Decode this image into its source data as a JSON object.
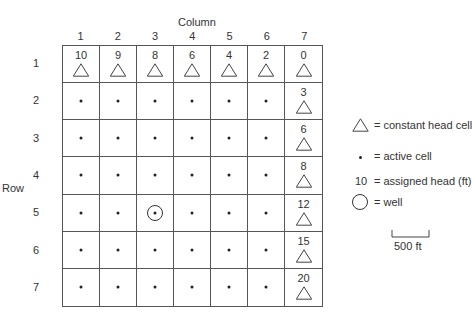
{
  "diagram": {
    "column_axis_title": "Column",
    "row_axis_title": "Row",
    "column_labels": [
      "1",
      "2",
      "3",
      "4",
      "5",
      "6",
      "7"
    ],
    "row_labels": [
      "1",
      "2",
      "3",
      "4",
      "5",
      "6",
      "7"
    ],
    "cells": [
      [
        {
          "type": "constant",
          "head": "10"
        },
        {
          "type": "constant",
          "head": "9"
        },
        {
          "type": "constant",
          "head": "8"
        },
        {
          "type": "constant",
          "head": "6"
        },
        {
          "type": "constant",
          "head": "4"
        },
        {
          "type": "constant",
          "head": "2"
        },
        {
          "type": "constant",
          "head": "0"
        }
      ],
      [
        {
          "type": "active"
        },
        {
          "type": "active"
        },
        {
          "type": "active"
        },
        {
          "type": "active"
        },
        {
          "type": "active"
        },
        {
          "type": "active"
        },
        {
          "type": "constant",
          "head": "3"
        }
      ],
      [
        {
          "type": "active"
        },
        {
          "type": "active"
        },
        {
          "type": "active"
        },
        {
          "type": "active"
        },
        {
          "type": "active"
        },
        {
          "type": "active"
        },
        {
          "type": "constant",
          "head": "6"
        }
      ],
      [
        {
          "type": "active"
        },
        {
          "type": "active"
        },
        {
          "type": "active"
        },
        {
          "type": "active"
        },
        {
          "type": "active"
        },
        {
          "type": "active"
        },
        {
          "type": "constant",
          "head": "8"
        }
      ],
      [
        {
          "type": "active"
        },
        {
          "type": "active"
        },
        {
          "type": "well"
        },
        {
          "type": "active"
        },
        {
          "type": "active"
        },
        {
          "type": "active"
        },
        {
          "type": "constant",
          "head": "12"
        }
      ],
      [
        {
          "type": "active"
        },
        {
          "type": "active"
        },
        {
          "type": "active"
        },
        {
          "type": "active"
        },
        {
          "type": "active"
        },
        {
          "type": "active"
        },
        {
          "type": "constant",
          "head": "15"
        }
      ],
      [
        {
          "type": "active"
        },
        {
          "type": "active"
        },
        {
          "type": "active"
        },
        {
          "type": "active"
        },
        {
          "type": "active"
        },
        {
          "type": "active"
        },
        {
          "type": "constant",
          "head": "20"
        }
      ]
    ]
  },
  "legend": {
    "constant_head": "= constant head cell",
    "active_cell": "= active cell",
    "assigned_head_sample": "10",
    "assigned_head": "= assigned head (ft)",
    "well": "= well",
    "scale_label": "500 ft"
  }
}
